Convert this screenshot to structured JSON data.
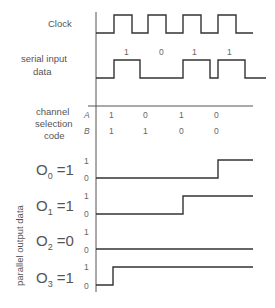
{
  "diagram": {
    "labels": {
      "clock": "Clock",
      "serial_line1": "serial input",
      "serial_line2": "data",
      "channel_line1": "channel",
      "channel_line2": "selection",
      "channel_line3": "code",
      "parallel": "parallel output data"
    },
    "serial_bits": [
      "1",
      "0",
      "1",
      "1"
    ],
    "code_rows": {
      "A": {
        "name": "A",
        "values": [
          "1",
          "0",
          "1",
          "0"
        ]
      },
      "B": {
        "name": "B",
        "values": [
          "1",
          "1",
          "0",
          "0"
        ]
      }
    },
    "outputs": [
      {
        "name": "O",
        "sub": "0",
        "eq": " =1",
        "hi": "1",
        "lo": "0"
      },
      {
        "name": "O",
        "sub": "1",
        "eq": " =1",
        "hi": "1",
        "lo": "0"
      },
      {
        "name": "O",
        "sub": "2",
        "eq": " =0",
        "hi": "1",
        "lo": "0"
      },
      {
        "name": "O",
        "sub": "3",
        "eq": " =1",
        "hi": "1",
        "lo": "0"
      }
    ],
    "colors": {
      "line": "#333333",
      "text": "#555555"
    }
  }
}
